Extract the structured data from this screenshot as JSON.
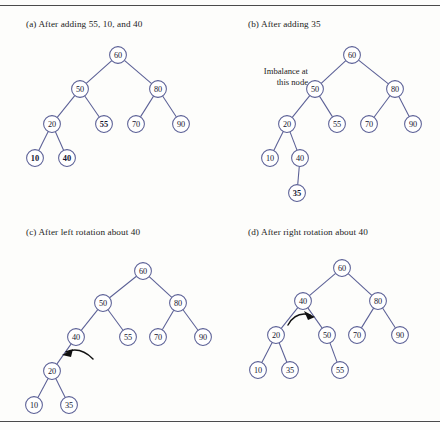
{
  "figure": {
    "title_rules": {
      "top": "horizontal-rule",
      "bottom": "horizontal-rule"
    },
    "panels": [
      {
        "id": "a",
        "caption": "(a) After adding 55, 10, and 40",
        "nodes": [
          {
            "label": "60",
            "x": 118,
            "y": 55,
            "bold": false
          },
          {
            "label": "50",
            "x": 80,
            "y": 89,
            "bold": false
          },
          {
            "label": "80",
            "x": 158,
            "y": 89,
            "bold": false
          },
          {
            "label": "20",
            "x": 52,
            "y": 124,
            "bold": false
          },
          {
            "label": "55",
            "x": 104,
            "y": 124,
            "bold": true
          },
          {
            "label": "70",
            "x": 136,
            "y": 124,
            "bold": false
          },
          {
            "label": "90",
            "x": 181,
            "y": 124,
            "bold": false
          },
          {
            "label": "10",
            "x": 35,
            "y": 158,
            "bold": true
          },
          {
            "label": "40",
            "x": 67,
            "y": 158,
            "bold": true
          }
        ],
        "edges": [
          [
            0,
            1
          ],
          [
            0,
            2
          ],
          [
            1,
            3
          ],
          [
            1,
            4
          ],
          [
            2,
            5
          ],
          [
            2,
            6
          ],
          [
            3,
            7
          ],
          [
            3,
            8
          ]
        ],
        "arrow": null,
        "annotation": null
      },
      {
        "id": "b",
        "caption": "(b) After adding 35",
        "nodes": [
          {
            "label": "60",
            "x": 352,
            "y": 55,
            "bold": false
          },
          {
            "label": "50",
            "x": 315,
            "y": 89,
            "bold": false
          },
          {
            "label": "80",
            "x": 395,
            "y": 89,
            "bold": false
          },
          {
            "label": "20",
            "x": 287,
            "y": 124,
            "bold": false
          },
          {
            "label": "55",
            "x": 337,
            "y": 124,
            "bold": false
          },
          {
            "label": "70",
            "x": 369,
            "y": 124,
            "bold": false
          },
          {
            "label": "90",
            "x": 413,
            "y": 124,
            "bold": false
          },
          {
            "label": "10",
            "x": 270,
            "y": 158,
            "bold": false
          },
          {
            "label": "40",
            "x": 300,
            "y": 158,
            "bold": false
          },
          {
            "label": "35",
            "x": 297,
            "y": 193,
            "bold": true
          }
        ],
        "edges": [
          [
            0,
            1
          ],
          [
            0,
            2
          ],
          [
            1,
            3
          ],
          [
            1,
            4
          ],
          [
            2,
            5
          ],
          [
            2,
            6
          ],
          [
            3,
            7
          ],
          [
            3,
            8
          ],
          [
            8,
            9
          ]
        ],
        "arrow": null,
        "annotation": {
          "line1": "Imbalance at",
          "line2": "this node"
        }
      },
      {
        "id": "c",
        "caption": "(c) After left rotation about 40",
        "nodes": [
          {
            "label": "60",
            "x": 143,
            "y": 271,
            "bold": false
          },
          {
            "label": "50",
            "x": 103,
            "y": 303,
            "bold": false
          },
          {
            "label": "80",
            "x": 178,
            "y": 303,
            "bold": false
          },
          {
            "label": "40",
            "x": 76,
            "y": 337,
            "bold": false
          },
          {
            "label": "55",
            "x": 128,
            "y": 337,
            "bold": false
          },
          {
            "label": "70",
            "x": 158,
            "y": 337,
            "bold": false
          },
          {
            "label": "90",
            "x": 203,
            "y": 337,
            "bold": false
          },
          {
            "label": "20",
            "x": 52,
            "y": 371,
            "bold": false
          },
          {
            "label": "10",
            "x": 34,
            "y": 405,
            "bold": false
          },
          {
            "label": "35",
            "x": 69,
            "y": 405,
            "bold": false
          }
        ],
        "edges": [
          [
            0,
            1
          ],
          [
            0,
            2
          ],
          [
            1,
            3
          ],
          [
            1,
            4
          ],
          [
            2,
            5
          ],
          [
            2,
            6
          ],
          [
            3,
            7
          ],
          [
            7,
            8
          ],
          [
            7,
            9
          ]
        ],
        "arrow": {
          "direction": "left-rotation-curve"
        },
        "annotation": null
      },
      {
        "id": "d",
        "caption": "(d) After right rotation about 40",
        "nodes": [
          {
            "label": "60",
            "x": 342,
            "y": 268,
            "bold": false
          },
          {
            "label": "40",
            "x": 303,
            "y": 301,
            "bold": false
          },
          {
            "label": "80",
            "x": 378,
            "y": 301,
            "bold": false
          },
          {
            "label": "20",
            "x": 276,
            "y": 335,
            "bold": false
          },
          {
            "label": "50",
            "x": 327,
            "y": 335,
            "bold": false
          },
          {
            "label": "70",
            "x": 357,
            "y": 335,
            "bold": false
          },
          {
            "label": "90",
            "x": 400,
            "y": 335,
            "bold": false
          },
          {
            "label": "10",
            "x": 258,
            "y": 370,
            "bold": false
          },
          {
            "label": "35",
            "x": 290,
            "y": 370,
            "bold": false
          },
          {
            "label": "55",
            "x": 340,
            "y": 370,
            "bold": false
          }
        ],
        "edges": [
          [
            0,
            1
          ],
          [
            0,
            2
          ],
          [
            1,
            3
          ],
          [
            1,
            4
          ],
          [
            2,
            5
          ],
          [
            2,
            6
          ],
          [
            3,
            7
          ],
          [
            3,
            8
          ],
          [
            4,
            9
          ]
        ],
        "arrow": {
          "direction": "right-rotation-curve"
        },
        "annotation": null
      }
    ],
    "colors": {
      "node_stroke": "#5a5f95",
      "node_fill": "#ffffff",
      "edge": "#5a5f95",
      "text": "#15152e",
      "arrow": "#111111",
      "rule": "#4a4a4a",
      "background": "#fdfdfb"
    },
    "node_radius": 8.4
  }
}
